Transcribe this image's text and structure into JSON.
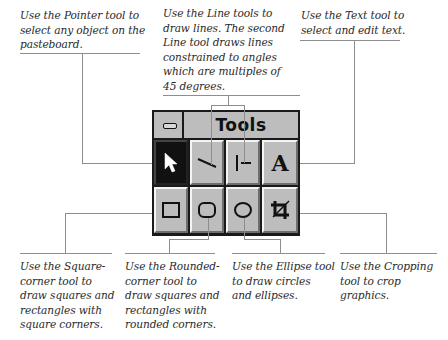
{
  "palette": {
    "title": "Tools",
    "close_box": "control-menu-box",
    "tools": [
      {
        "name": "Pointer",
        "icon": "arrow-pointer-icon",
        "selected": true
      },
      {
        "name": "Line",
        "icon": "diagonal-line-icon",
        "selected": false
      },
      {
        "name": "Constrained Line",
        "icon": "constrained-line-icon",
        "selected": false
      },
      {
        "name": "Text",
        "icon": "text-a-icon",
        "glyph": "A",
        "selected": false
      },
      {
        "name": "Square-corner",
        "icon": "square-icon",
        "selected": false
      },
      {
        "name": "Rounded-corner",
        "icon": "rounded-rect-icon",
        "selected": false
      },
      {
        "name": "Ellipse",
        "icon": "ellipse-icon",
        "selected": false
      },
      {
        "name": "Cropping",
        "icon": "crop-icon",
        "selected": false
      }
    ]
  },
  "callouts": {
    "pointer": [
      "Use the Pointer tool to",
      "select any object on the",
      "pasteboard."
    ],
    "line": [
      "Use the Line tools to",
      "draw lines. The second",
      "Line tool draws lines",
      "constrained to angles",
      "which are multiples of",
      "45 degrees."
    ],
    "text": [
      "Use the Text tool to",
      "select and edit text."
    ],
    "square": [
      "Use the Square-",
      "corner tool to",
      "draw squares and",
      "rectangles with",
      "square corners."
    ],
    "rounded": [
      "Use the Rounded-",
      "corner tool to",
      "draw squares and",
      "rectangles with",
      "rounded corners."
    ],
    "ellipse": [
      "Use the Ellipse tool",
      "to draw circles",
      "and ellipses."
    ],
    "crop": [
      "Use the Cropping",
      "tool to crop",
      "graphics."
    ]
  },
  "colors": {
    "palette_gray": "#bdbdbd",
    "palette_border": "#1a1a1a",
    "leader_line": "#8e8e8e",
    "caption_text": "#2a2a2a"
  }
}
